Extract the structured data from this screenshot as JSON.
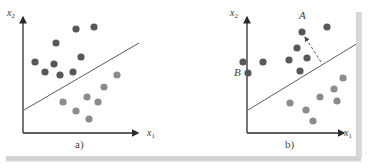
{
  "figure": {
    "background_color": "#ffffff",
    "axis_color": "#2b2b2b",
    "boundary_color": "#5a5a5a",
    "class1_color": "#585858",
    "class2_color": "#8c8c8c",
    "shadow_color": "#d4d4d4"
  },
  "panels": [
    {
      "id": "a",
      "caption": "a)",
      "caption_pos": {
        "x": 76,
        "y": 139
      },
      "y_axis_label": "x",
      "y_axis_sub": "2",
      "y_axis_label_pos": {
        "x": 7,
        "y": 8
      },
      "x_axis_label": "x",
      "x_axis_sub": "1",
      "x_axis_label_pos": {
        "x": 148,
        "y": 128
      },
      "axes": {
        "origin": {
          "x": 23,
          "y": 133
        },
        "y_top": {
          "x": 23,
          "y": 14
        },
        "x_right": {
          "x": 141,
          "y": 133
        }
      },
      "boundary": {
        "x1": 24,
        "y1": 110,
        "x2": 139,
        "y2": 43
      },
      "points_class1": [
        {
          "x": 56,
          "y": 43
        },
        {
          "x": 54,
          "y": 64
        },
        {
          "x": 81,
          "y": 57
        },
        {
          "x": 94,
          "y": 27
        },
        {
          "x": 76,
          "y": 29
        },
        {
          "x": 60,
          "y": 75
        },
        {
          "x": 73,
          "y": 72
        },
        {
          "x": 35,
          "y": 62
        },
        {
          "x": 45,
          "y": 72
        }
      ],
      "points_class2": [
        {
          "x": 117,
          "y": 75
        },
        {
          "x": 104,
          "y": 87
        },
        {
          "x": 87,
          "y": 97
        },
        {
          "x": 98,
          "y": 102
        },
        {
          "x": 63,
          "y": 102
        },
        {
          "x": 76,
          "y": 111
        },
        {
          "x": 89,
          "y": 119
        }
      ]
    },
    {
      "id": "b",
      "caption": "b)",
      "caption_pos": {
        "x": 286,
        "y": 139
      },
      "y_axis_label": "x",
      "y_axis_sub": "2",
      "y_axis_label_pos": {
        "x": 230,
        "y": 8
      },
      "x_axis_label": "x",
      "x_axis_sub": "1",
      "x_axis_label_pos": {
        "x": 345,
        "y": 128
      },
      "axes": {
        "origin": {
          "x": 247,
          "y": 133
        },
        "y_top": {
          "x": 247,
          "y": 14
        },
        "x_right": {
          "x": 347,
          "y": 133
        }
      },
      "boundary": {
        "x1": 248,
        "y1": 110,
        "x2": 358,
        "y2": 43
      },
      "annotations": [
        {
          "label": "A",
          "x": 301,
          "y": 13,
          "point": {
            "x": 302,
            "y": 32
          }
        },
        {
          "label": "B",
          "x": 238,
          "y": 68,
          "point": {
            "x": 248,
            "y": 73
          }
        }
      ],
      "arrow": {
        "x1": 321,
        "y1": 62,
        "x2": 304,
        "y2": 36,
        "style": "dashed"
      },
      "points_class1": [
        {
          "x": 302,
          "y": 32
        },
        {
          "x": 327,
          "y": 27
        },
        {
          "x": 297,
          "y": 48
        },
        {
          "x": 307,
          "y": 58
        },
        {
          "x": 289,
          "y": 60
        },
        {
          "x": 300,
          "y": 71
        },
        {
          "x": 263,
          "y": 62
        },
        {
          "x": 248,
          "y": 73
        },
        {
          "x": 243,
          "y": 62
        }
      ],
      "points_class2": [
        {
          "x": 343,
          "y": 78
        },
        {
          "x": 334,
          "y": 89
        },
        {
          "x": 320,
          "y": 97
        },
        {
          "x": 337,
          "y": 101
        },
        {
          "x": 290,
          "y": 103
        },
        {
          "x": 306,
          "y": 110
        },
        {
          "x": 313,
          "y": 121
        }
      ]
    }
  ]
}
